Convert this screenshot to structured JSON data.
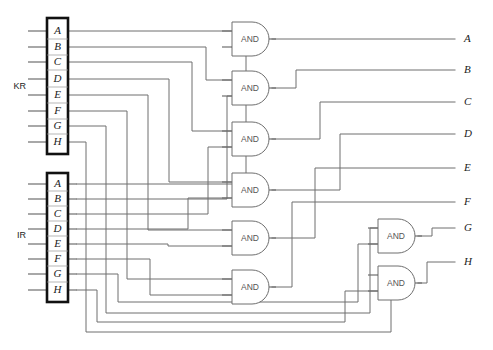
{
  "diagram": {
    "wire_color": "#6e6e6e",
    "register_border_color": "#111111",
    "gate_fill": "#ffffff",
    "label_color": "#222222"
  },
  "registers": [
    {
      "name": "KR",
      "id": "kr",
      "bits": [
        "A",
        "B",
        "C",
        "D",
        "E",
        "F",
        "G",
        "H"
      ]
    },
    {
      "name": "IR",
      "id": "ir",
      "bits": [
        "A",
        "B",
        "C",
        "D",
        "E",
        "F",
        "G",
        "H"
      ]
    }
  ],
  "gates": [
    {
      "id": "and1",
      "label": "AND"
    },
    {
      "id": "and2",
      "label": "AND"
    },
    {
      "id": "and3",
      "label": "AND"
    },
    {
      "id": "and4",
      "label": "AND"
    },
    {
      "id": "and5",
      "label": "AND"
    },
    {
      "id": "and6",
      "label": "AND"
    },
    {
      "id": "and7",
      "label": "AND"
    },
    {
      "id": "and8",
      "label": "AND"
    }
  ],
  "outputs": [
    {
      "id": "out-a",
      "label": "A"
    },
    {
      "id": "out-b",
      "label": "B"
    },
    {
      "id": "out-c",
      "label": "C"
    },
    {
      "id": "out-d",
      "label": "D"
    },
    {
      "id": "out-e",
      "label": "E"
    },
    {
      "id": "out-f",
      "label": "F"
    },
    {
      "id": "out-g",
      "label": "G"
    },
    {
      "id": "out-h",
      "label": "H"
    }
  ]
}
